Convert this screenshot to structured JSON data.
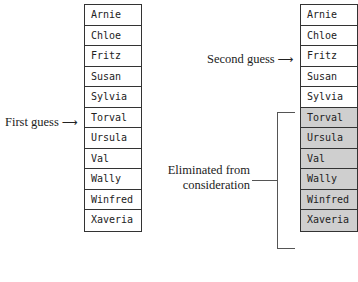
{
  "left_list": {
    "items": [
      "Arnie",
      "Chloe",
      "Fritz",
      "Susan",
      "Sylvia",
      "Torval",
      "Ursula",
      "Val",
      "Wally",
      "Winfred",
      "Xaveria"
    ],
    "guess_label": "First guess",
    "guess_index": 5
  },
  "right_list": {
    "items": [
      "Arnie",
      "Chloe",
      "Fritz",
      "Susan",
      "Sylvia",
      "Torval",
      "Ursula",
      "Val",
      "Wally",
      "Winfred",
      "Xaveria"
    ],
    "guess_label": "Second guess",
    "guess_index": 2,
    "eliminated_from_index": 5
  },
  "eliminated_label": {
    "line1": "Eliminated from",
    "line2": "consideration"
  },
  "arrow_glyph": "⟶",
  "colors": {
    "eliminated_fill": "#cfcfcf",
    "border": "#333333"
  }
}
